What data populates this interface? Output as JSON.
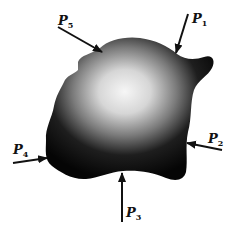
{
  "figure": {
    "body_fill": {
      "center": "#f4f4f4",
      "edge": "#0a0a0a"
    },
    "arrow_color": "#111111",
    "forces": [
      {
        "name": "P",
        "sub": "1",
        "label_x": 190,
        "label_y": 12
      },
      {
        "name": "P",
        "sub": "2",
        "label_x": 206,
        "label_y": 134
      },
      {
        "name": "P",
        "sub": "3",
        "label_x": 125,
        "label_y": 208
      },
      {
        "name": "P",
        "sub": "4",
        "label_x": 13,
        "label_y": 144
      },
      {
        "name": "P",
        "sub": "5",
        "label_x": 57,
        "label_y": 19
      }
    ]
  }
}
